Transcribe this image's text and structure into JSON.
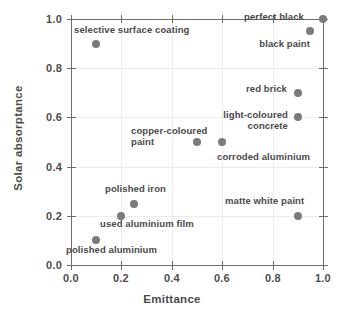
{
  "chart_data": {
    "type": "scatter",
    "title": "",
    "xlabel": "Emittance",
    "ylabel": "Solar absorptance",
    "xlim": [
      0.0,
      1.0
    ],
    "ylim": [
      0.0,
      1.0
    ],
    "grid": true,
    "legend": "none",
    "marker_color": "#7b7b7b",
    "axis_color": "#6d6d6d",
    "grid_color": "#ececec",
    "xticks": [
      "0.0",
      "0.2",
      "0.4",
      "0.6",
      "0.8",
      "1.0"
    ],
    "xtick_values": [
      0.0,
      0.2,
      0.4,
      0.6,
      0.8,
      1.0
    ],
    "yticks": [
      "0.0",
      "0.2",
      "0.4",
      "0.6",
      "0.8",
      "1.0"
    ],
    "ytick_values": [
      0.0,
      0.2,
      0.4,
      0.6,
      0.8,
      1.0
    ],
    "points": [
      {
        "label": "perfect black",
        "x": 1.0,
        "y": 1.0
      },
      {
        "label": "black paint",
        "x": 0.95,
        "y": 0.95
      },
      {
        "label": "selective surface coating",
        "x": 0.1,
        "y": 0.9
      },
      {
        "label": "red brick",
        "x": 0.9,
        "y": 0.7
      },
      {
        "label": "light-coloured\nconcrete",
        "x": 0.9,
        "y": 0.6
      },
      {
        "label": "copper-coloured\npaint",
        "x": 0.5,
        "y": 0.5
      },
      {
        "label": "corroded aluminium",
        "x": 0.6,
        "y": 0.5
      },
      {
        "label": "polished iron",
        "x": 0.25,
        "y": 0.25
      },
      {
        "label": "used aluminium film",
        "x": 0.2,
        "y": 0.2
      },
      {
        "label": "matte white paint",
        "x": 0.9,
        "y": 0.2
      },
      {
        "label": "polished aluminium",
        "x": 0.1,
        "y": 0.1
      }
    ]
  },
  "annotations": [
    {
      "text": "perfect black",
      "left": 304,
      "top": 12,
      "align": "right"
    },
    {
      "text": "black paint",
      "left": 310,
      "top": 39,
      "align": "right"
    },
    {
      "text": "selective surface coating",
      "left": 74,
      "top": 25,
      "align": "left"
    },
    {
      "text": "red brick",
      "left": 287,
      "top": 84,
      "align": "right"
    },
    {
      "text": "light-coloured",
      "left": 288,
      "top": 110,
      "align": "right"
    },
    {
      "text": "concrete",
      "left": 288,
      "top": 121,
      "align": "right"
    },
    {
      "text": "copper-coloured",
      "left": 131,
      "top": 126,
      "align": "left"
    },
    {
      "text": "paint",
      "left": 131,
      "top": 137,
      "align": "left"
    },
    {
      "text": "corroded aluminium",
      "left": 217,
      "top": 152,
      "align": "left"
    },
    {
      "text": "polished iron",
      "left": 105,
      "top": 184,
      "align": "left"
    },
    {
      "text": "used aluminium film",
      "left": 100,
      "top": 219,
      "align": "left"
    },
    {
      "text": "matte white paint",
      "left": 225,
      "top": 196,
      "align": "left"
    },
    {
      "text": "polished aluminium",
      "left": 66,
      "top": 245,
      "align": "left"
    }
  ]
}
